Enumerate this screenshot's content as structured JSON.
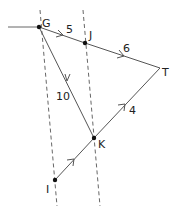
{
  "diagram": {
    "type": "directed-weighted-graph",
    "colors": {
      "edge": "#555555",
      "node": "#111111",
      "dashed": "#555555",
      "text": "#222222"
    },
    "nodes": [
      {
        "id": "G",
        "label": "G"
      },
      {
        "id": "J",
        "label": "J"
      },
      {
        "id": "T",
        "label": "T"
      },
      {
        "id": "K",
        "label": "K"
      },
      {
        "id": "I",
        "label": "I"
      }
    ],
    "edges": [
      {
        "from": "external",
        "to": "G",
        "weight": ""
      },
      {
        "from": "G",
        "to": "J",
        "weight": "5"
      },
      {
        "from": "J",
        "to": "T",
        "weight": "6"
      },
      {
        "from": "G",
        "to": "K",
        "weight": "10"
      },
      {
        "from": "K",
        "to": "T",
        "weight": "4"
      },
      {
        "from": "I",
        "to": "K",
        "weight": ""
      }
    ],
    "cut_lines": 2
  }
}
